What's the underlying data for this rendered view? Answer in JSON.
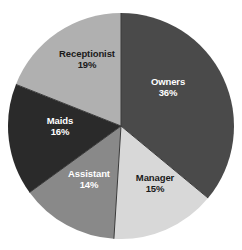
{
  "chart_data": {
    "type": "pie",
    "title": "",
    "subtitle": "",
    "xlabel": "",
    "ylabel": "",
    "legend_position": "none",
    "grid": false,
    "labels_inside_slices": true,
    "start_angle_deg": 0,
    "direction": "clockwise",
    "categories": [
      "Owners",
      "Manager",
      "Assistant",
      "Maids",
      "Receptionist"
    ],
    "values": [
      36,
      15,
      14,
      16,
      19
    ],
    "value_unit": "%",
    "colors": [
      "#4a4a4a",
      "#d8d8d8",
      "#898989",
      "#2a2a2a",
      "#b0b0b0"
    ],
    "slices": [
      {
        "name": "Owners",
        "value": 36,
        "percent_text": "36%",
        "color": "#4a4a4a",
        "text_color": "#ffffff",
        "start_deg": 0,
        "end_deg": 129.6,
        "label_x": 168,
        "label_y": 88
      },
      {
        "name": "Manager",
        "value": 15,
        "percent_text": "15%",
        "color": "#d8d8d8",
        "text_color": "#1a1a1a",
        "start_deg": 129.6,
        "end_deg": 183.6,
        "label_x": 155,
        "label_y": 184
      },
      {
        "name": "Assistant",
        "value": 14,
        "percent_text": "14%",
        "color": "#898989",
        "text_color": "#ffffff",
        "start_deg": 183.6,
        "end_deg": 234.0,
        "label_x": 89,
        "label_y": 180
      },
      {
        "name": "Maids",
        "value": 16,
        "percent_text": "16%",
        "color": "#2a2a2a",
        "text_color": "#ffffff",
        "start_deg": 234.0,
        "end_deg": 291.6,
        "label_x": 60,
        "label_y": 127
      },
      {
        "name": "Receptionist",
        "value": 19,
        "percent_text": "19%",
        "color": "#b0b0b0",
        "text_color": "#1a1a1a",
        "start_deg": 291.6,
        "end_deg": 360,
        "label_x": 87,
        "label_y": 60
      }
    ],
    "geometry": {
      "center_x": 121,
      "center_y": 126,
      "radius": 113
    },
    "style": {
      "background": "#ffffff",
      "divider_color": "#3a3a3a",
      "divider_width": 1
    }
  }
}
